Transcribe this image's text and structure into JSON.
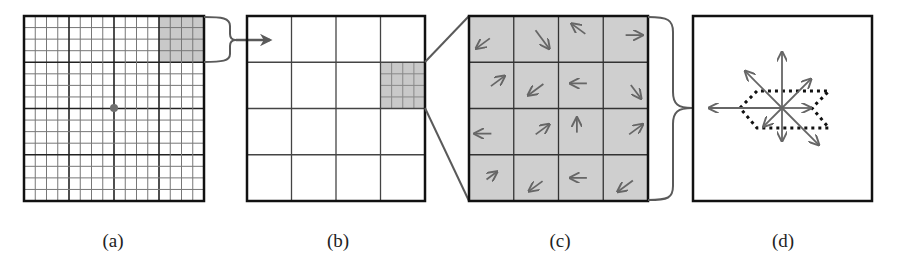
{
  "figure": {
    "panels": [
      {
        "id": "a",
        "label": "(a)",
        "caption_x": 113,
        "content": "16x16 pixel grid around keypoint with 4x4 subregion highlighted"
      },
      {
        "id": "b",
        "label": "(b)",
        "caption_x": 338,
        "content": "4x4 grid of subregions, one subregion subdivided"
      },
      {
        "id": "c",
        "label": "(c)",
        "caption_x": 560,
        "content": "4x4 cells with gradient orientation arrows"
      },
      {
        "id": "d",
        "label": "(d)",
        "caption_x": 783,
        "content": "8-bin orientation histogram"
      }
    ]
  },
  "colors": {
    "stroke": "#111111",
    "grid_fine": "#555555",
    "highlight": "#c9c9c9",
    "arrow": "#666666",
    "connector": "#5a5a5a",
    "keypoint": "#6f6f6f",
    "histogram_outline": "#111111"
  },
  "panel_a": {
    "box": [
      24,
      16,
      180,
      185
    ],
    "fine_divisions": 16,
    "coarse_every": 4,
    "highlight_cell": {
      "row": 0,
      "col": 3
    },
    "keypoint": [
      114,
      108
    ]
  },
  "panel_b": {
    "box": [
      247,
      16,
      178,
      185
    ],
    "divisions": 4,
    "highlight_cell": {
      "row": 1,
      "col": 3
    },
    "sub_divisions": 4
  },
  "panel_c": {
    "box": [
      469,
      16,
      179,
      185
    ],
    "divisions": 4,
    "gradient_arrows": [
      [
        "down-left",
        "down-right",
        "up-left",
        "right"
      ],
      [
        "up-right",
        "down-left",
        "left",
        "down-right"
      ],
      [
        "left",
        "up-right",
        "up",
        "up-right"
      ],
      [
        "up-right",
        "down-left",
        "left",
        "down-left"
      ]
    ]
  },
  "panel_d": {
    "box": [
      693,
      16,
      179,
      185
    ],
    "histogram_bins": [
      {
        "direction": "right",
        "angle_deg": 0,
        "length": 28
      },
      {
        "direction": "up-right",
        "angle_deg": 45,
        "length": 40
      },
      {
        "direction": "up",
        "angle_deg": 90,
        "length": 55
      },
      {
        "direction": "up-left",
        "angle_deg": 135,
        "length": 51
      },
      {
        "direction": "left",
        "angle_deg": 180,
        "length": 72
      },
      {
        "direction": "down-left",
        "angle_deg": 225,
        "length": 25
      },
      {
        "direction": "down",
        "angle_deg": 270,
        "length": 32
      },
      {
        "direction": "down-right",
        "angle_deg": 315,
        "length": 51
      }
    ]
  }
}
